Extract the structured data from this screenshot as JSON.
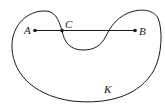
{
  "diagram": {
    "region_label": "K",
    "points": [
      {
        "id": "A",
        "label": "A",
        "x": 35,
        "y": 30.5
      },
      {
        "id": "C",
        "label": "C",
        "x": 62,
        "y": 30.5
      },
      {
        "id": "B",
        "label": "B",
        "x": 135,
        "y": 30.5
      }
    ],
    "segment": {
      "from": "A",
      "to": "B"
    },
    "colors": {
      "stroke": "#1a1a1a",
      "background": "#ffffff"
    }
  }
}
